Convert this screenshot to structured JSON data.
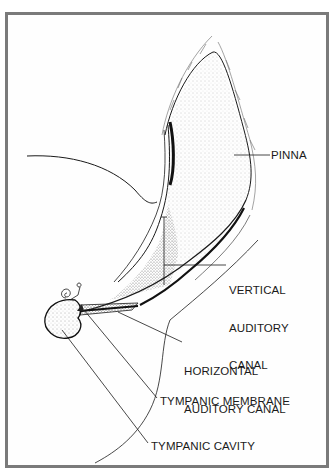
{
  "diagram": {
    "type": "anatomical-illustration",
    "colors": {
      "frame": "#7a7a7a",
      "ink": "#1a1a1a",
      "background": "#ffffff"
    },
    "labels": {
      "pinna": "PINNA",
      "vertical_line1": "VERTICAL",
      "vertical_line2": "AUDITORY",
      "vertical_line3": "CANAL",
      "horizontal_line1": "HORIZONTAL",
      "horizontal_line2": "AUDITORY CANAL",
      "tympanic_membrane": "TYMPANIC MEMBRANE",
      "tympanic_cavity": "TYMPANIC CAVITY"
    }
  }
}
